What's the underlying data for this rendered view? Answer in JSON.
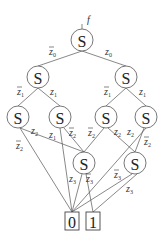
{
  "diagram": {
    "root_label": "f",
    "nodes": [
      {
        "id": "n0",
        "label": "S",
        "x": 82,
        "y": 40
      },
      {
        "id": "n1a",
        "label": "S",
        "x": 38,
        "y": 77
      },
      {
        "id": "n1b",
        "label": "S",
        "x": 126,
        "y": 77
      },
      {
        "id": "n2a",
        "label": "S",
        "x": 18,
        "y": 117
      },
      {
        "id": "n2b",
        "label": "S",
        "x": 60,
        "y": 117
      },
      {
        "id": "n2c",
        "label": "S",
        "x": 106,
        "y": 117
      },
      {
        "id": "n2d",
        "label": "S",
        "x": 146,
        "y": 117
      },
      {
        "id": "n3a",
        "label": "S",
        "x": 84,
        "y": 163
      },
      {
        "id": "n3b",
        "label": "S",
        "x": 135,
        "y": 163
      }
    ],
    "terminals": [
      {
        "id": "t0",
        "label": "0"
      },
      {
        "id": "t1",
        "label": "1"
      }
    ],
    "edge_labels": {
      "z0bar": "z̅",
      "z0": "z",
      "sub0": "0",
      "sub1": "1",
      "sub2": "2",
      "sub3": "3"
    }
  }
}
